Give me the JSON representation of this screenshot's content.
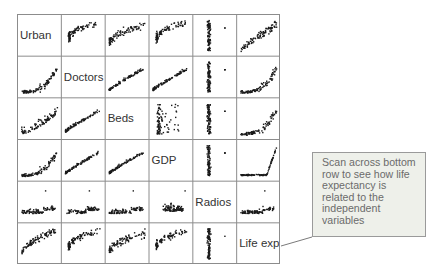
{
  "chart_data": {
    "type": "scatter-matrix",
    "title": "",
    "variables": [
      "Urban",
      "Doctors",
      "Beds",
      "GDP",
      "Radios",
      "Life exp"
    ],
    "grid": true,
    "layout": {
      "rows": 6,
      "cols": 6,
      "diagonal": "variable labels"
    },
    "cells": [
      [
        null,
        "steep-log",
        "log-spread",
        "steep-log",
        "vertical",
        "linear-up"
      ],
      [
        "convex",
        null,
        "cluster-up",
        "cluster-up",
        "vertical",
        "convex"
      ],
      [
        "spread-up",
        "cluster-up",
        null,
        "vertical-cluster",
        "vertical",
        "convex"
      ],
      [
        "convex",
        "cluster-up",
        "cluster-up",
        null,
        "vertical",
        "flat-then-up"
      ],
      [
        "flat",
        "flat",
        "flat",
        "flat-cluster",
        null,
        "flat"
      ],
      [
        "concave",
        "steep-log",
        "log-spread",
        "steep-log",
        "vertical",
        null
      ]
    ]
  },
  "callout": {
    "lines": [
      "Scan across bottom",
      "row to see how life",
      "expectancy is",
      "related to the",
      "independent",
      "variables"
    ]
  },
  "colors": {
    "point": "#1a1a1a",
    "grid": "#8c8c8c",
    "label": "#333333",
    "callout_bg": "#eef0ea",
    "callout_border": "#9a9a9a",
    "callout_text": "#6b6b6b"
  }
}
